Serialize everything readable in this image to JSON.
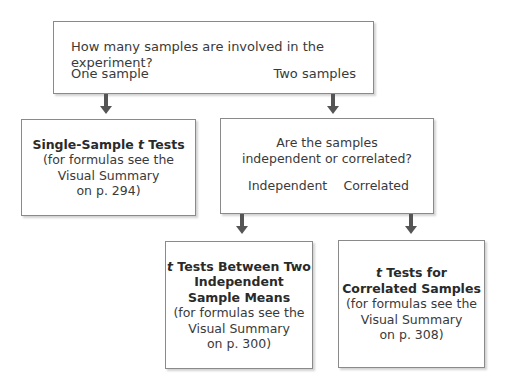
{
  "diagram": {
    "type": "decision-flowchart",
    "top_box": {
      "question": "How many samples are involved in the experiment?",
      "option_left": "One sample",
      "option_right": "Two samples"
    },
    "single_sample_box": {
      "title_pre": "Single-Sample ",
      "title_t": "t",
      "title_post": " Tests",
      "line1": "(for formulas see the",
      "line2": "Visual Summary",
      "line3": "on p. 294)"
    },
    "two_samples_box": {
      "question_line1": "Are the samples",
      "question_line2": "independent or correlated?",
      "option_left": "Independent",
      "option_right": "Correlated"
    },
    "independent_box": {
      "title_t": "t",
      "title_line1": " Tests Between Two",
      "title_line2": "Independent",
      "title_line3": "Sample Means",
      "line1": "(for formulas see the",
      "line2": "Visual Summary",
      "line3": "on p. 300)"
    },
    "correlated_box": {
      "title_t": "t",
      "title_line1": " Tests for",
      "title_line2": "Correlated Samples",
      "line1": "(for formulas see the",
      "line2": "Visual Summary",
      "line3": "on p. 308)"
    },
    "colors": {
      "border": "#8a8a8a",
      "arrow": "#555555",
      "text": "#3a3a3a"
    }
  }
}
